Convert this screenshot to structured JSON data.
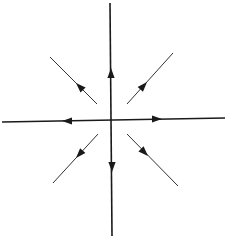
{
  "diagram": {
    "type": "phase-portrait",
    "colors": {
      "axis": "#1a1a1a",
      "trajectory": "#333333",
      "background": "#ffffff"
    },
    "origin": [
      111,
      121
    ],
    "axes": [
      {
        "name": "vertical-axis",
        "from": [
          110,
          3
        ],
        "to": [
          112,
          236
        ]
      },
      {
        "name": "horizontal-axis",
        "from": [
          2,
          122
        ],
        "to": [
          225,
          118
        ]
      }
    ],
    "axis_arrows": [
      {
        "name": "arrow-up",
        "tip": [
          111,
          68
        ],
        "direction": "up"
      },
      {
        "name": "arrow-down",
        "tip": [
          112,
          172
        ],
        "direction": "down"
      },
      {
        "name": "arrow-left",
        "tip": [
          62,
          121
        ],
        "direction": "left"
      },
      {
        "name": "arrow-right",
        "tip": [
          162,
          119
        ],
        "direction": "right"
      }
    ],
    "trajectories": [
      {
        "name": "upper-left",
        "from": [
          97,
          104
        ],
        "to": [
          50,
          57
        ],
        "arrow_tip": [
          76,
          83
        ]
      },
      {
        "name": "upper-right",
        "from": [
          127,
          104
        ],
        "to": [
          173,
          53
        ],
        "arrow_tip": [
          147,
          82
        ]
      },
      {
        "name": "lower-left",
        "from": [
          98,
          134
        ],
        "to": [
          53,
          183
        ],
        "arrow_tip": [
          76,
          158
        ]
      },
      {
        "name": "lower-right",
        "from": [
          127,
          134
        ],
        "to": [
          178,
          186
        ],
        "arrow_tip": [
          148,
          156
        ]
      }
    ]
  }
}
